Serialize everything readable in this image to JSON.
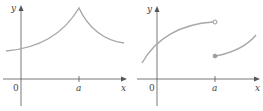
{
  "colors": {
    "axis": "#555555",
    "curve": "#a8a8a8",
    "text": "#444444",
    "background": "#ffffff"
  },
  "graphs": [
    {
      "id": "left",
      "description": "Continuous curve with a cusp (sharp peak) at x = a",
      "labels": {
        "y_axis": "y",
        "x_axis": "x",
        "origin": "0",
        "a_tick": "a"
      }
    },
    {
      "id": "right",
      "description": "Jump discontinuity at x = a: left branch ends with open circle, right branch starts with closed (filled) dot below",
      "labels": {
        "y_axis": "y",
        "x_axis": "x",
        "origin": "0",
        "a_tick": "a"
      }
    }
  ]
}
